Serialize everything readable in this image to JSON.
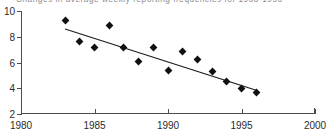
{
  "chart_data": {
    "type": "scatter",
    "title": "Changes in average weekly reporting frequencies for 1983-1996",
    "xlabel": "",
    "ylabel": "",
    "xlim": [
      1980,
      2000
    ],
    "ylim": [
      2,
      10
    ],
    "grid": false,
    "legend": "none",
    "x_ticks": [
      1980,
      1985,
      1990,
      1995,
      2000
    ],
    "y_ticks": [
      2,
      4,
      6,
      8,
      10
    ],
    "x": [
      1983,
      1984,
      1985,
      1986,
      1987,
      1988,
      1989,
      1990,
      1991,
      1992,
      1993,
      1994,
      1995,
      1996
    ],
    "values": [
      9.3,
      7.65,
      7.2,
      8.9,
      7.15,
      6.05,
      7.15,
      5.4,
      6.85,
      6.2,
      5.3,
      4.55,
      3.95,
      3.7
    ],
    "series": [
      {
        "name": "Average weekly reporting frequency",
        "values": [
          9.3,
          7.65,
          7.2,
          8.9,
          7.15,
          6.05,
          7.15,
          5.4,
          6.85,
          6.2,
          5.3,
          4.55,
          3.95,
          3.7
        ]
      }
    ],
    "trendline": {
      "type": "linear-fit",
      "x_start": 1983,
      "y_start": 8.6,
      "x_end": 1996,
      "y_end": 3.85
    },
    "marker": "filled-diamond",
    "marker_color": "#111111",
    "line_color": "#1a1a1a",
    "axis_color": "#4c4c4c"
  },
  "axes": {
    "y_tick_labels": [
      "10",
      "8",
      "6",
      "4",
      "2"
    ],
    "x_tick_labels": [
      "1980",
      "1985",
      "1990",
      "1995",
      "2000"
    ]
  }
}
